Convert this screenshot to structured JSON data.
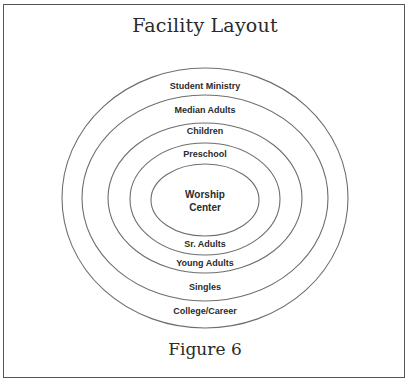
{
  "figure": {
    "title": "Facility Layout",
    "caption": "Figure 6"
  },
  "diagram": {
    "center": {
      "x": 205,
      "y": 199
    },
    "stroke_color": "#6e6e6e",
    "rings": [
      {
        "name": "ring-1-outer",
        "rx": 143,
        "ry": 130,
        "top_label": "Student Ministry",
        "bottom_label": "College/Career"
      },
      {
        "name": "ring-2",
        "rx": 123,
        "ry": 103,
        "top_label": "Median Adults",
        "bottom_label": "Singles"
      },
      {
        "name": "ring-3",
        "rx": 97,
        "ry": 75,
        "top_label": "Children",
        "bottom_label": "Young Adults"
      },
      {
        "name": "ring-4",
        "rx": 75,
        "ry": 56,
        "top_label": "Preschool",
        "bottom_label": "Sr. Adults"
      },
      {
        "name": "core",
        "rx": 54,
        "ry": 36,
        "label_line_1": "Worship",
        "label_line_2": "Center"
      }
    ]
  }
}
